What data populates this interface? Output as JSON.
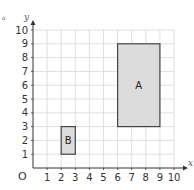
{
  "chart_data": {
    "type": "diagram",
    "title": "",
    "xlabel": "x",
    "ylabel": "y",
    "origin_label": "O",
    "xlim": [
      0,
      10
    ],
    "ylim": [
      0,
      10
    ],
    "grid": true,
    "x_ticks": [
      "1",
      "2",
      "3",
      "4",
      "5",
      "6",
      "7",
      "8",
      "9",
      "10"
    ],
    "y_ticks": [
      "1",
      "2",
      "3",
      "4",
      "5",
      "6",
      "7",
      "8",
      "9",
      "10"
    ],
    "shapes": [
      {
        "label": "A",
        "type": "rectangle",
        "x1": 6,
        "y1": 3,
        "x2": 9,
        "y2": 9,
        "fill": "#dcdcdc",
        "stroke": "#444444"
      },
      {
        "label": "B",
        "type": "rectangle",
        "x1": 2,
        "y1": 1,
        "x2": 3,
        "y2": 3,
        "fill": "#dcdcdc",
        "stroke": "#444444"
      }
    ]
  },
  "colors": {
    "grid": "#d8d8d8",
    "axis": "#333333",
    "shape_fill": "#dcdcdc",
    "shape_stroke": "#444444"
  },
  "corner_mark": "a"
}
